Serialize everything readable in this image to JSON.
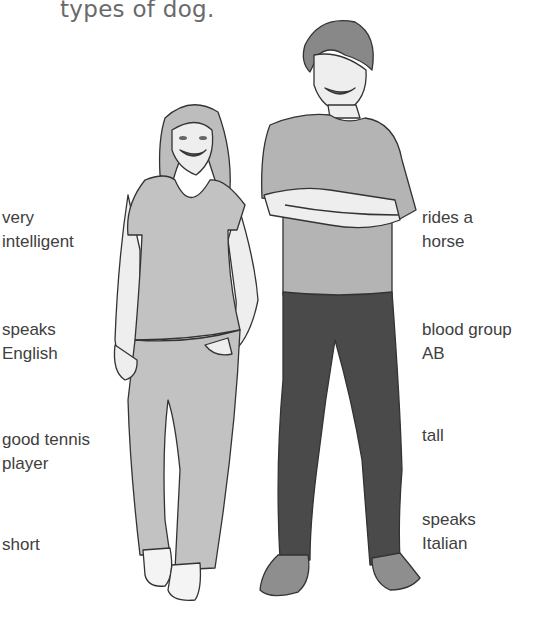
{
  "heading": {
    "text": "types of dog."
  },
  "illustration": {
    "description": "Illustration of a short girl (left) and a tall boy with arms crossed (right)",
    "girl": {
      "name": "girl-figure"
    },
    "boy": {
      "name": "boy-figure"
    }
  },
  "labels": {
    "left": [
      {
        "id": "very-intelligent",
        "text": "very\nintelligent"
      },
      {
        "id": "speaks-english",
        "text": "speaks\nEnglish"
      },
      {
        "id": "good-tennis-player",
        "text": "good tennis\nplayer"
      },
      {
        "id": "short",
        "text": "short"
      }
    ],
    "right": [
      {
        "id": "rides-a-horse",
        "text": "rides a\nhorse"
      },
      {
        "id": "blood-group-ab",
        "text": "blood group\nAB"
      },
      {
        "id": "tall",
        "text": "tall"
      },
      {
        "id": "speaks-italian",
        "text": "speaks\nItalian"
      }
    ]
  },
  "colors": {
    "text": "#404040",
    "heading": "#6a6a6a",
    "girl_clothes": "#c2c2c2",
    "boy_shirt": "#b4b4b4",
    "boy_jeans": "#4a4a4a",
    "boy_hair": "#888888",
    "skin": "#eeeeee",
    "outline": "#333333"
  }
}
